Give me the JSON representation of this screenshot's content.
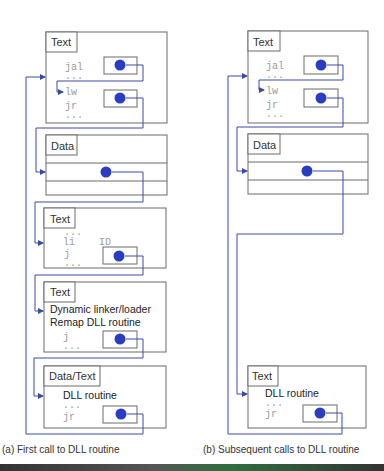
{
  "colors": {
    "pointer": "#2a3cc0",
    "wire": "#3a4aa8",
    "border": "#6a6a6a",
    "code": "#9a9a9a"
  },
  "panel_a": {
    "caption": "(a)  First call to DLL routine",
    "boxes": [
      {
        "tab": "Text",
        "lines": [
          "jal",
          "...",
          "lw",
          "jr",
          "..."
        ]
      },
      {
        "tab": "Data"
      },
      {
        "tab": "Text",
        "lines": [
          "...",
          "li",
          "ID",
          "j",
          "..."
        ]
      },
      {
        "tab": "Text",
        "lines": [
          "Dynamic linker/loader",
          "Remap DLL routine",
          "j",
          "..."
        ]
      },
      {
        "tab": "Data/Text",
        "lines": [
          "DLL routine",
          "...",
          "jr"
        ]
      }
    ]
  },
  "panel_b": {
    "caption": "(b)  Subsequent calls to DLL routine",
    "boxes": [
      {
        "tab": "Text",
        "lines": [
          "jal",
          "...",
          "lw",
          "jr",
          "..."
        ]
      },
      {
        "tab": "Data"
      },
      {
        "tab": "Text",
        "lines": [
          "DLL routine",
          "...",
          "jr"
        ]
      }
    ]
  }
}
